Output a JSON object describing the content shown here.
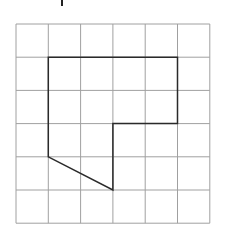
{
  "diagram": {
    "type": "grid-polygon",
    "grid": {
      "cols": 6,
      "rows": 6,
      "origin_px": [
        16,
        24
      ],
      "cell_w": 32.3,
      "cell_h": 33.2,
      "line_color": "#a0a0a0"
    },
    "polygon": {
      "vertices_grid": [
        [
          1,
          1
        ],
        [
          5,
          1
        ],
        [
          5,
          3
        ],
        [
          3,
          3
        ],
        [
          3,
          5
        ],
        [
          1,
          4
        ]
      ],
      "stroke_color": "#2a2a2a",
      "stroke_width": 1.5,
      "fill": "none"
    },
    "top_fragment": "partially cropped text"
  }
}
